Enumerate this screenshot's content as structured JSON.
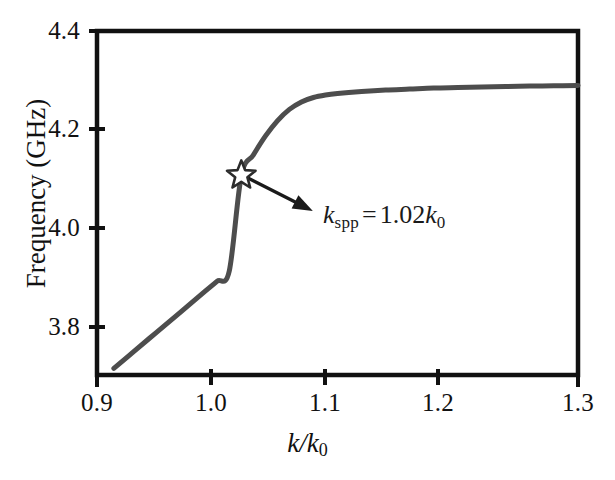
{
  "chart_data": {
    "type": "line",
    "title": "",
    "xlabel": "k/k0",
    "ylabel": "Frequency (GHz)",
    "xlim": [
      0.9,
      1.3
    ],
    "ylim": [
      3.7066,
      4.4
    ],
    "grid": false,
    "legend": null,
    "xticks": [
      0.9,
      1.0,
      1.1,
      1.2,
      1.3
    ],
    "xtick_labels": [
      "0.9",
      "1.0",
      "1.1",
      "1.2",
      "1.3"
    ],
    "yticks": [
      3.8,
      4.0,
      4.2,
      4.4
    ],
    "ytick_labels": [
      "3.8",
      "4.0",
      "4.2",
      "4.4"
    ],
    "series": [
      {
        "name": "SPP dispersion",
        "color": "#4d4d4d",
        "linewidth": 5,
        "x": [
          0.914,
          0.93,
          0.95,
          0.97,
          0.99,
          1.0,
          1.01,
          1.02,
          1.03,
          1.04,
          1.05,
          1.06,
          1.07,
          1.08,
          1.09,
          1.1,
          1.12,
          1.14,
          1.16,
          1.18,
          1.2,
          1.22,
          1.24,
          1.26,
          1.28,
          1.3
        ],
        "y": [
          3.72,
          3.7527,
          3.7936,
          3.8345,
          3.8755,
          3.8959,
          3.9163,
          4.1082,
          4.15,
          4.188,
          4.219,
          4.242,
          4.257,
          4.266,
          4.271,
          4.274,
          4.278,
          4.281,
          4.283,
          4.285,
          4.286,
          4.287,
          4.288,
          4.289,
          4.2895,
          4.29
        ]
      }
    ],
    "markers": [
      {
        "name": "k-spp-star",
        "shape": "star",
        "x": 1.02,
        "y": 4.109,
        "fill": "#ffffff",
        "stroke": "#2b2b2b",
        "size": 30
      }
    ],
    "annotations": [
      {
        "name": "k-spp-annotation",
        "text_parts": {
          "symbol": "k",
          "subscript": "spp",
          "equals": "=",
          "value": "1.02",
          "unit_symbol": "k",
          "unit_subscript": "0"
        },
        "text": "k_spp = 1.02 k_0",
        "arrow_from": {
          "x": 1.0255,
          "y": 4.1035
        },
        "arrow_to": {
          "x": 1.0795,
          "y": 4.0373
        }
      }
    ]
  },
  "axes": {
    "frame_color": "#111111",
    "frame_width": 4,
    "background": "#ffffff"
  },
  "labels": {
    "ylabel_text": "Frequency (GHz)",
    "xlabel_symbol": "k/k",
    "xlabel_subscript": "0"
  }
}
